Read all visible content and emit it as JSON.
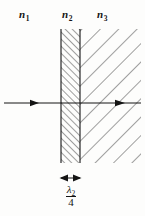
{
  "figure": {
    "kind": "optical-thin-film-diagram",
    "width": 145,
    "height": 216,
    "background_color": "#fdfdfc",
    "ink_color": "#141414"
  },
  "labels": {
    "medium_1": {
      "symbol": "n",
      "subscript": "1"
    },
    "medium_2": {
      "symbol": "n",
      "subscript": "2"
    },
    "medium_3": {
      "symbol": "n",
      "subscript": "3"
    }
  },
  "thickness": {
    "numerator_symbol": "λ",
    "numerator_subscript": "2",
    "denominator": "4"
  },
  "regions": {
    "film": {
      "left": 61,
      "right": 80,
      "top": 29,
      "bottom": 163,
      "hatch_direction": "up-right",
      "hatch_spacing": 5
    },
    "substrate": {
      "left": 80,
      "right": 141,
      "top": 29,
      "bottom": 163,
      "hatch_direction": "down-right",
      "hatch_spacing": 13
    }
  },
  "ray": {
    "y": 103,
    "start_x": 4,
    "end_x": 141,
    "arrow_1_x": 37,
    "arrow_2_x": 124
  },
  "dimension_arrow": {
    "y": 178,
    "left_x": 61,
    "right_x": 80
  }
}
